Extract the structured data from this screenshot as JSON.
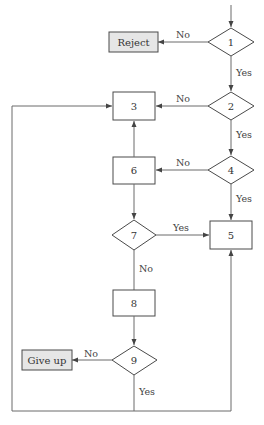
{
  "diagram": {
    "type": "flowchart",
    "nodes": [
      {
        "id": "1",
        "shape": "diamond",
        "label": "1"
      },
      {
        "id": "2",
        "shape": "diamond",
        "label": "2"
      },
      {
        "id": "3",
        "shape": "box",
        "label": "3"
      },
      {
        "id": "4",
        "shape": "diamond",
        "label": "4"
      },
      {
        "id": "5",
        "shape": "box",
        "label": "5"
      },
      {
        "id": "6",
        "shape": "box",
        "label": "6"
      },
      {
        "id": "7",
        "shape": "diamond",
        "label": "7"
      },
      {
        "id": "8",
        "shape": "box",
        "label": "8"
      },
      {
        "id": "9",
        "shape": "diamond",
        "label": "9"
      },
      {
        "id": "reject",
        "shape": "terminal",
        "label": "Reject"
      },
      {
        "id": "giveup",
        "shape": "terminal",
        "label": "Give up"
      }
    ],
    "edges": [
      {
        "from": "1",
        "to": "reject",
        "label": "No"
      },
      {
        "from": "1",
        "to": "2",
        "label": "Yes"
      },
      {
        "from": "2",
        "to": "3",
        "label": "No"
      },
      {
        "from": "2",
        "to": "4",
        "label": "Yes"
      },
      {
        "from": "4",
        "to": "6",
        "label": "No"
      },
      {
        "from": "4",
        "to": "5",
        "label": "Yes"
      },
      {
        "from": "6",
        "to": "3",
        "label": ""
      },
      {
        "from": "6",
        "to": "7",
        "label": ""
      },
      {
        "from": "7",
        "to": "5",
        "label": "Yes"
      },
      {
        "from": "7",
        "to": "8",
        "label": "No"
      },
      {
        "from": "8",
        "to": "9",
        "label": ""
      },
      {
        "from": "9",
        "to": "giveup",
        "label": "No"
      },
      {
        "from": "9",
        "to": "3",
        "label": "Yes"
      },
      {
        "from": "9",
        "to": "5",
        "label": "Yes"
      }
    ],
    "labels": {
      "yes": "Yes",
      "no": "No"
    }
  }
}
